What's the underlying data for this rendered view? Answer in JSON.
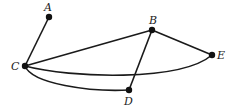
{
  "graph": {
    "nodes": [
      {
        "id": "A",
        "label": "A",
        "x": 49,
        "y": 17,
        "lx": 44,
        "ly": 11
      },
      {
        "id": "B",
        "label": "B",
        "x": 152,
        "y": 30,
        "lx": 149,
        "ly": 24
      },
      {
        "id": "C",
        "label": "C",
        "x": 25,
        "y": 66,
        "lx": 11,
        "ly": 70
      },
      {
        "id": "D",
        "label": "D",
        "x": 129,
        "y": 90,
        "lx": 124,
        "ly": 105
      },
      {
        "id": "E",
        "label": "E",
        "x": 212,
        "y": 55,
        "lx": 217,
        "ly": 59
      }
    ],
    "edges": [
      {
        "from": "A",
        "to": "C",
        "shape": "straight"
      },
      {
        "from": "C",
        "to": "B",
        "shape": "straight"
      },
      {
        "from": "B",
        "to": "E",
        "shape": "straight"
      },
      {
        "from": "B",
        "to": "D",
        "shape": "straight"
      },
      {
        "from": "C",
        "to": "E",
        "shape": "curved"
      },
      {
        "from": "C",
        "to": "D",
        "shape": "curved"
      }
    ],
    "colors": {
      "edge": "#1a1a1a",
      "node": "#111111",
      "label": "#222222"
    }
  }
}
